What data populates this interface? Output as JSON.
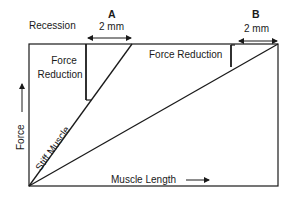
{
  "diagram": {
    "labels": {
      "recession": "Recession",
      "a_title": "A",
      "a_distance": "2 mm",
      "b_title": "B",
      "b_distance": "2 mm",
      "force_reduction_left_line1": "Force",
      "force_reduction_left_line2": "Reduction",
      "force_reduction_right": "Force Reduction",
      "y_axis": "Force",
      "x_axis": "Muscle Length",
      "stiff_muscle": "Stiff Muscle"
    },
    "colors": {
      "line": "#1a1a1a",
      "background": "#ffffff"
    }
  }
}
